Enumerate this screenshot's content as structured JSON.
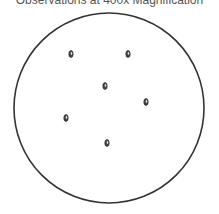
{
  "title": "Observations at 400x Magnification",
  "field_of_view": {
    "cx": 109,
    "cy": 108,
    "r": 95,
    "stroke": "#333333"
  },
  "specimens": [
    {
      "x": 71,
      "y": 54
    },
    {
      "x": 128,
      "y": 54
    },
    {
      "x": 105,
      "y": 86
    },
    {
      "x": 146,
      "y": 102
    },
    {
      "x": 66,
      "y": 118
    },
    {
      "x": 107,
      "y": 143
    }
  ]
}
